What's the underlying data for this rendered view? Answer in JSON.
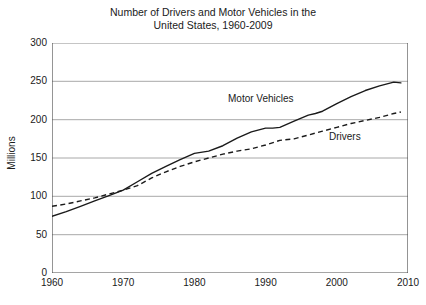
{
  "chart_data": {
    "type": "line",
    "title": "Number of Drivers and Motor Vehicles in the\nUnited States, 1960-2009",
    "title_line1": "Number of Drivers and Motor Vehicles in the",
    "title_line2": "United States, 1960-2009",
    "xlabel": "",
    "ylabel": "Millions",
    "xlim": [
      1960,
      2010
    ],
    "ylim": [
      0,
      300
    ],
    "xticks": [
      1960,
      1970,
      1980,
      1990,
      2000,
      2010
    ],
    "xtick_labels": [
      "1960",
      "1970",
      "1980",
      "1990",
      "2000",
      "2010"
    ],
    "yticks": [
      0,
      50,
      100,
      150,
      200,
      250,
      300
    ],
    "ytick_labels": [
      "0",
      "50",
      "100",
      "150",
      "200",
      "250",
      "300"
    ],
    "grid": "horizontal",
    "legend_position": "inline-annotations",
    "series": [
      {
        "name": "Motor Vehicles",
        "style": "solid",
        "color": "#1a1a1a",
        "annotation_label": "Motor Vehicles",
        "x": [
          1960,
          1962,
          1964,
          1966,
          1968,
          1970,
          1972,
          1974,
          1976,
          1978,
          1980,
          1982,
          1984,
          1986,
          1988,
          1990,
          1991,
          1992,
          1994,
          1996,
          1997,
          1998,
          2000,
          2002,
          2004,
          2006,
          2008,
          2009
        ],
        "values": [
          74,
          80,
          87,
          94,
          101,
          108,
          119,
          130,
          139,
          148,
          156,
          159,
          166,
          176,
          184,
          189,
          189,
          190,
          198,
          206,
          208,
          211,
          221,
          230,
          238,
          244,
          249,
          248
        ]
      },
      {
        "name": "Drivers",
        "style": "dashed",
        "color": "#1a1a1a",
        "annotation_label": "Drivers",
        "x": [
          1960,
          1962,
          1964,
          1966,
          1968,
          1970,
          1972,
          1974,
          1976,
          1978,
          1980,
          1982,
          1984,
          1986,
          1988,
          1990,
          1992,
          1994,
          1996,
          1998,
          2000,
          2002,
          2004,
          2006,
          2008,
          2009
        ],
        "values": [
          87,
          90,
          94,
          98,
          103,
          108,
          114,
          124,
          132,
          139,
          145,
          150,
          155,
          159,
          162,
          167,
          173,
          175,
          180,
          185,
          190,
          195,
          199,
          203,
          208,
          210
        ]
      }
    ]
  }
}
